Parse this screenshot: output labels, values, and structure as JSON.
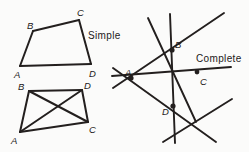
{
  "figure": {
    "background_color": "#fbfbfa",
    "ink_color": "#231f1e",
    "width": 249,
    "height": 152
  },
  "captions": {
    "simple": "Simple",
    "complete": "Complete"
  },
  "simple_quadrilateral": {
    "name": "simple-quadrilateral",
    "vertex_labels": {
      "a": "A",
      "b": "B",
      "c": "C",
      "d": "D"
    },
    "vertices": {
      "A": [
        20,
        66
      ],
      "B": [
        33,
        31
      ],
      "C": [
        79,
        20
      ],
      "D": [
        91,
        64
      ]
    },
    "label_positions": {
      "A": [
        14,
        70
      ],
      "B": [
        27,
        21
      ],
      "C": [
        77,
        8
      ],
      "D": [
        89,
        69
      ]
    },
    "edges": [
      [
        "A",
        "B"
      ],
      [
        "B",
        "C"
      ],
      [
        "C",
        "D"
      ],
      [
        "D",
        "A"
      ]
    ],
    "caption_position": [
      88,
      31
    ]
  },
  "crossed_quadrilateral": {
    "name": "crossed-quadrilateral",
    "vertex_labels": {
      "a": "A",
      "b": "B",
      "c": "C",
      "d": "D"
    },
    "vertices": {
      "A": [
        20,
        132
      ],
      "B": [
        29,
        91
      ],
      "C": [
        88,
        122
      ],
      "D": [
        82,
        90
      ]
    },
    "label_positions": {
      "A": [
        11,
        136
      ],
      "B": [
        18,
        82
      ],
      "C": [
        89,
        125
      ],
      "D": [
        84,
        81
      ]
    },
    "edges": [
      [
        "A",
        "B"
      ],
      [
        "B",
        "D"
      ],
      [
        "D",
        "C"
      ],
      [
        "C",
        "A"
      ]
    ],
    "crossing_point": [
      56,
      106
    ]
  },
  "complete_quadrilateral": {
    "name": "complete-quadrilateral",
    "vertex_labels": {
      "a": "A",
      "b": "B",
      "c": "C",
      "d": "D"
    },
    "nodes": {
      "A": [
        131,
        78
      ],
      "B": [
        172,
        50
      ],
      "C": [
        197,
        72
      ],
      "D": [
        173,
        106
      ]
    },
    "label_positions": {
      "A": [
        125,
        68
      ],
      "B": [
        175,
        40
      ],
      "C": [
        200,
        77
      ],
      "D": [
        162,
        107
      ]
    },
    "lines": [
      {
        "id": "vertical",
        "from": [
          170,
          14
        ],
        "to": [
          175,
          143
        ]
      },
      {
        "id": "b-steep",
        "from": [
          148,
          18
        ],
        "to": [
          196,
          122
        ]
      },
      {
        "id": "a-b-up",
        "from": [
          113,
          88
        ],
        "to": [
          224,
          13
        ]
      },
      {
        "id": "a-c-flat",
        "from": [
          112,
          76
        ],
        "to": [
          231,
          67
        ]
      },
      {
        "id": "a-d-down",
        "from": [
          113,
          68
        ],
        "to": [
          216,
          142
        ]
      },
      {
        "id": "d-right",
        "from": [
          163,
          142
        ],
        "to": [
          232,
          99
        ]
      }
    ],
    "caption_position": [
      196,
      54
    ]
  }
}
